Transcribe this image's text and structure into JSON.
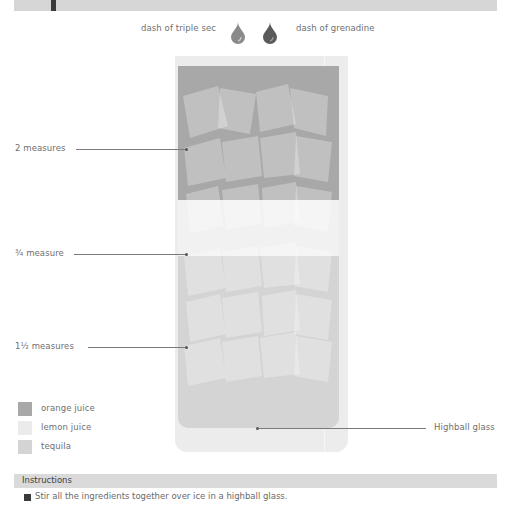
{
  "header": {
    "bar_color": "#d6d6d6"
  },
  "garnish": {
    "left_label": "dash of triple sec",
    "right_label": "dash of grenadine",
    "drops": [
      {
        "name": "triple-sec-drop",
        "color": "#8a8a8a"
      },
      {
        "name": "grenadine-drop",
        "color": "#5a5a5a"
      }
    ]
  },
  "glass": {
    "label": "Highball glass",
    "color": "#ececec"
  },
  "layers": [
    {
      "ingredient": "orange juice",
      "measure": "2 measures",
      "color": "#a8a8a8"
    },
    {
      "ingredient": "lemon juice",
      "measure": "¾ measure",
      "color": "#f1f1f1"
    },
    {
      "ingredient": "tequila",
      "measure": "1½ measures",
      "color": "#d4d4d4"
    }
  ],
  "legend": [
    {
      "label": "orange juice",
      "color": "#a8a8a8"
    },
    {
      "label": "lemon juice",
      "color": "#ebebeb"
    },
    {
      "label": "tequila",
      "color": "#d4d4d4"
    }
  ],
  "instructions": {
    "title": "Instructions",
    "steps": [
      {
        "number": "1",
        "text": "Stir all the ingredients together over ice in a highball glass."
      }
    ]
  }
}
